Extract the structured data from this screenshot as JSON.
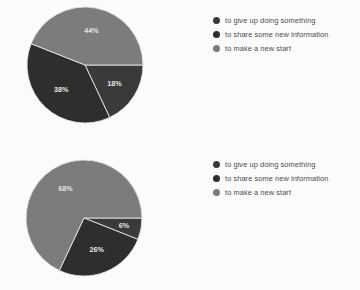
{
  "background_color": "#fcfcfc",
  "colors": {
    "series_dark": "#3a3a3a",
    "series_darker": "#2e2e2e",
    "series_light": "#7c7c7c",
    "label_text": "#e8e8e8",
    "legend_text": "#4a4a4a",
    "slice_edge": "#e6e6e6"
  },
  "legend": {
    "items": [
      {
        "label": "to give up doing something",
        "color": "#3a3a3a",
        "marker": "circle-marker"
      },
      {
        "label": "to share some new information",
        "color": "#2e2e2e",
        "marker": "circle-marker"
      },
      {
        "label": "to make a new start",
        "color": "#7c7c7c",
        "marker": "circle-marker"
      }
    ]
  },
  "chart_data": [
    {
      "type": "pie",
      "title": "",
      "categories": [
        "to give up doing something",
        "to share some new information",
        "to make a new start"
      ],
      "values": [
        18,
        38,
        44
      ],
      "labels": [
        "18%",
        "38%",
        "44%"
      ],
      "colors": [
        "#3a3a3a",
        "#2e2e2e",
        "#7c7c7c"
      ],
      "start_angle_deg": 0,
      "direction": "clockwise",
      "legend_position": "right",
      "grid": false
    },
    {
      "type": "pie",
      "title": "",
      "categories": [
        "to give up doing something",
        "to share some new information",
        "to make a new start"
      ],
      "values": [
        6,
        26,
        68
      ],
      "labels": [
        "6%",
        "26%",
        "68%"
      ],
      "colors": [
        "#3a3a3a",
        "#2e2e2e",
        "#7c7c7c"
      ],
      "start_angle_deg": 0,
      "direction": "clockwise",
      "legend_position": "right",
      "grid": false
    }
  ]
}
